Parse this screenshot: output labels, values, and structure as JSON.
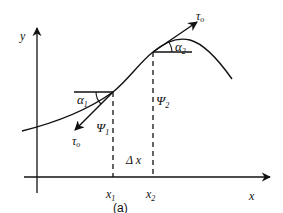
{
  "figure": {
    "caption": "(a)",
    "axes": {
      "x_label": "x",
      "y_label": "y"
    },
    "points": [
      {
        "x_label": "x",
        "x_sub": "1",
        "angle_label": "α",
        "angle_sub": "1",
        "psi_label": "Ψ",
        "psi_sub": "1",
        "tangent_label": "τ",
        "tangent_sub": "o"
      },
      {
        "x_label": "x",
        "x_sub": "2",
        "angle_label": "α",
        "angle_sub": "2",
        "psi_label": "Ψ",
        "psi_sub": "2",
        "tangent_label": "τ",
        "tangent_sub": "o"
      }
    ],
    "delta_label": "Δ x",
    "colors": {
      "ink": "#111111",
      "background": "#ffffff"
    }
  }
}
